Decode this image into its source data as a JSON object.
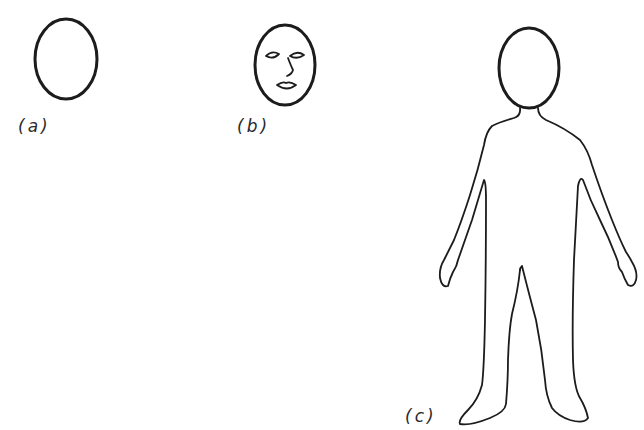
{
  "figure": {
    "panels": [
      {
        "id": "a",
        "label": "(a)",
        "description": "empty oval head outline"
      },
      {
        "id": "b",
        "label": "(b)",
        "description": "oval head with simple facial features (eyes, nose, mouth)"
      },
      {
        "id": "c",
        "label": "(c)",
        "description": "full body outline figure with oval head"
      }
    ],
    "colors": {
      "background": "#ffffff",
      "ink": "#1c1c1c"
    }
  }
}
